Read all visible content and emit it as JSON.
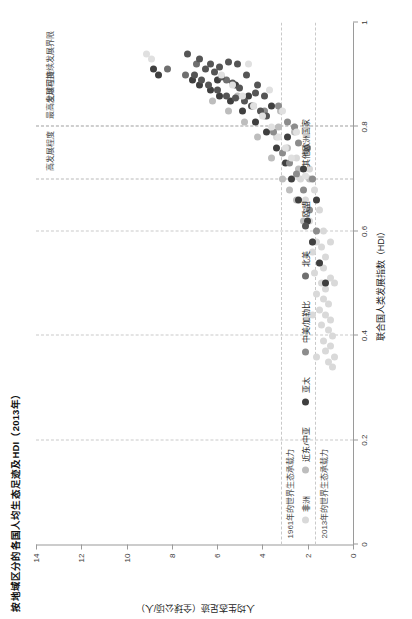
{
  "chart_data": {
    "type": "scatter",
    "title": "按地域区分的各国人均生态足迹及HDI（2013年）",
    "xlabel": "联合国人类发展指数（HDI）",
    "ylabel": "人均生态足迹（全球公顷/人）",
    "xlim": [
      0,
      1
    ],
    "ylim": [
      0,
      14
    ],
    "xticks": [
      "0",
      "0.2",
      "0.4",
      "0.6",
      "0.8",
      "1"
    ],
    "xtick_values": [
      0,
      0.2,
      0.4,
      0.6,
      0.8,
      1
    ],
    "yticks": [
      "0",
      "2",
      "4",
      "6",
      "8",
      "10",
      "12",
      "14"
    ],
    "ytick_values": [
      0,
      2,
      4,
      6,
      8,
      10,
      12,
      14
    ],
    "grid": "dashed",
    "legend_position": "bottom-left",
    "annotations": [
      {
        "name": "global-sustainable-limit",
        "text": "全球可持续发展界限"
      },
      {
        "name": "high-development",
        "text": "高发展程度"
      },
      {
        "name": "highest-development",
        "text": "最高发展程度"
      },
      {
        "name": "biocapacity-1961",
        "text": "1961年的世界生态承载力",
        "y": 3.2
      },
      {
        "name": "biocapacity-2013",
        "text": "2013年的世界生态承载力",
        "y": 1.7
      }
    ],
    "reference_lines": {
      "hdi_high": 0.7,
      "hdi_highest": 0.8,
      "biocapacity_1961": 3.2,
      "biocapacity_2013": 1.7
    },
    "series": [
      {
        "name": "非洲",
        "color": "#d9d9d9",
        "points": [
          [
            0.34,
            0.9
          ],
          [
            0.35,
            1.1
          ],
          [
            0.36,
            0.8
          ],
          [
            0.37,
            1.2
          ],
          [
            0.38,
            1.0
          ],
          [
            0.39,
            1.3
          ],
          [
            0.4,
            0.9
          ],
          [
            0.41,
            1.1
          ],
          [
            0.42,
            1.4
          ],
          [
            0.43,
            1.0
          ],
          [
            0.44,
            1.2
          ],
          [
            0.45,
            1.5
          ],
          [
            0.46,
            1.1
          ],
          [
            0.47,
            1.3
          ],
          [
            0.48,
            1.6
          ],
          [
            0.49,
            1.2
          ],
          [
            0.5,
            1.4
          ],
          [
            0.51,
            1.0
          ],
          [
            0.52,
            1.7
          ],
          [
            0.53,
            1.3
          ],
          [
            0.54,
            1.5
          ],
          [
            0.55,
            1.2
          ],
          [
            0.56,
            1.8
          ],
          [
            0.57,
            1.4
          ],
          [
            0.58,
            1.6
          ],
          [
            0.6,
            1.3
          ],
          [
            0.62,
            1.9
          ],
          [
            0.64,
            1.5
          ],
          [
            0.66,
            2.1
          ],
          [
            0.68,
            1.7
          ],
          [
            0.7,
            2.3
          ],
          [
            0.72,
            1.9
          ],
          [
            0.74,
            2.5
          ],
          [
            0.76,
            2.0
          ],
          [
            0.78,
            3.4
          ],
          [
            0.8,
            2.6
          ],
          [
            0.36,
            1.6
          ],
          [
            0.44,
            1.8
          ],
          [
            0.5,
            0.8
          ],
          [
            0.58,
            1.0
          ]
        ]
      },
      {
        "name": "近东/中亚",
        "color": "#bdbdbd",
        "points": [
          [
            0.58,
            1.8
          ],
          [
            0.62,
            2.2
          ],
          [
            0.66,
            2.5
          ],
          [
            0.68,
            2.8
          ],
          [
            0.7,
            3.1
          ],
          [
            0.72,
            2.4
          ],
          [
            0.74,
            3.6
          ],
          [
            0.76,
            2.9
          ],
          [
            0.78,
            4.2
          ],
          [
            0.8,
            3.3
          ],
          [
            0.81,
            4.8
          ],
          [
            0.82,
            3.9
          ],
          [
            0.83,
            5.5
          ],
          [
            0.84,
            4.4
          ],
          [
            0.85,
            6.2
          ],
          [
            0.86,
            5.1
          ],
          [
            0.7,
            1.9
          ],
          [
            0.75,
            2.1
          ],
          [
            0.79,
            2.6
          ],
          [
            0.83,
            3.2
          ]
        ]
      },
      {
        "name": "亚太",
        "color": "#3f3f3f",
        "points": [
          [
            0.5,
            1.2
          ],
          [
            0.54,
            1.5
          ],
          [
            0.58,
            1.8
          ],
          [
            0.62,
            2.0
          ],
          [
            0.66,
            2.4
          ],
          [
            0.7,
            2.7
          ],
          [
            0.73,
            3.0
          ],
          [
            0.76,
            3.4
          ],
          [
            0.79,
            3.8
          ],
          [
            0.81,
            4.3
          ],
          [
            0.83,
            4.9
          ],
          [
            0.85,
            5.4
          ],
          [
            0.86,
            5.9
          ],
          [
            0.87,
            6.3
          ],
          [
            0.88,
            6.8
          ],
          [
            0.89,
            7.1
          ],
          [
            0.9,
            8.6
          ],
          [
            0.91,
            8.8
          ],
          [
            0.66,
            1.6
          ],
          [
            0.72,
            2.2
          ],
          [
            0.78,
            2.9
          ],
          [
            0.84,
            3.6
          ],
          [
            0.86,
            4.6
          ],
          [
            0.88,
            5.2
          ],
          [
            0.89,
            6.0
          ]
        ]
      },
      {
        "name": "中美/加勒比",
        "color": "#8c8c8c",
        "points": [
          [
            0.6,
            1.6
          ],
          [
            0.64,
            1.9
          ],
          [
            0.68,
            2.2
          ],
          [
            0.71,
            2.5
          ],
          [
            0.73,
            2.8
          ],
          [
            0.75,
            3.1
          ],
          [
            0.77,
            2.4
          ],
          [
            0.79,
            3.5
          ],
          [
            0.81,
            2.9
          ],
          [
            0.83,
            3.9
          ],
          [
            0.7,
            1.8
          ],
          [
            0.76,
            2.0
          ],
          [
            0.8,
            2.6
          ],
          [
            0.84,
            3.3
          ]
        ]
      },
      {
        "name": "北美",
        "color": "#6f6f6f",
        "points": [
          [
            0.91,
            8.2
          ],
          [
            0.92,
            6.9
          ],
          [
            0.9,
            7.4
          ],
          [
            0.89,
            5.6
          ]
        ]
      },
      {
        "name": "欧盟",
        "color": "#555555",
        "points": [
          [
            0.82,
            3.8
          ],
          [
            0.83,
            4.1
          ],
          [
            0.84,
            4.5
          ],
          [
            0.85,
            4.8
          ],
          [
            0.855,
            5.2
          ],
          [
            0.86,
            5.6
          ],
          [
            0.865,
            4.3
          ],
          [
            0.87,
            6.0
          ],
          [
            0.875,
            5.0
          ],
          [
            0.88,
            6.4
          ],
          [
            0.885,
            5.3
          ],
          [
            0.89,
            6.7
          ],
          [
            0.895,
            5.8
          ],
          [
            0.9,
            7.0
          ],
          [
            0.905,
            6.1
          ],
          [
            0.91,
            6.5
          ],
          [
            0.915,
            5.9
          ],
          [
            0.92,
            6.3
          ],
          [
            0.925,
            5.5
          ],
          [
            0.93,
            6.8
          ],
          [
            0.86,
            3.9
          ],
          [
            0.88,
            4.2
          ],
          [
            0.9,
            4.7
          ],
          [
            0.92,
            5.1
          ],
          [
            0.94,
            7.3
          ]
        ]
      },
      {
        "name": "其他欧洲国家",
        "color": "#e0e0e0",
        "points": [
          [
            0.74,
            2.7
          ],
          [
            0.76,
            3.0
          ],
          [
            0.78,
            3.3
          ],
          [
            0.8,
            3.6
          ],
          [
            0.82,
            4.0
          ],
          [
            0.84,
            4.4
          ],
          [
            0.86,
            4.9
          ],
          [
            0.88,
            5.3
          ],
          [
            0.9,
            5.8
          ],
          [
            0.92,
            4.6
          ],
          [
            0.93,
            8.9
          ],
          [
            0.94,
            9.1
          ],
          [
            0.79,
            2.5
          ],
          [
            0.83,
            3.1
          ],
          [
            0.87,
            3.7
          ]
        ]
      }
    ]
  },
  "legend": {
    "items": [
      {
        "label": "非洲",
        "color": "#d9d9d9"
      },
      {
        "label": "近东/中亚",
        "color": "#bdbdbd"
      },
      {
        "label": "亚太",
        "color": "#3f3f3f"
      },
      {
        "label": "中美/加勒比",
        "color": "#8c8c8c"
      },
      {
        "label": "北美",
        "color": "#6f6f6f"
      },
      {
        "label": "欧盟",
        "color": "#555555"
      },
      {
        "label": "其他欧洲国家",
        "color": "#e0e0e0"
      }
    ]
  }
}
